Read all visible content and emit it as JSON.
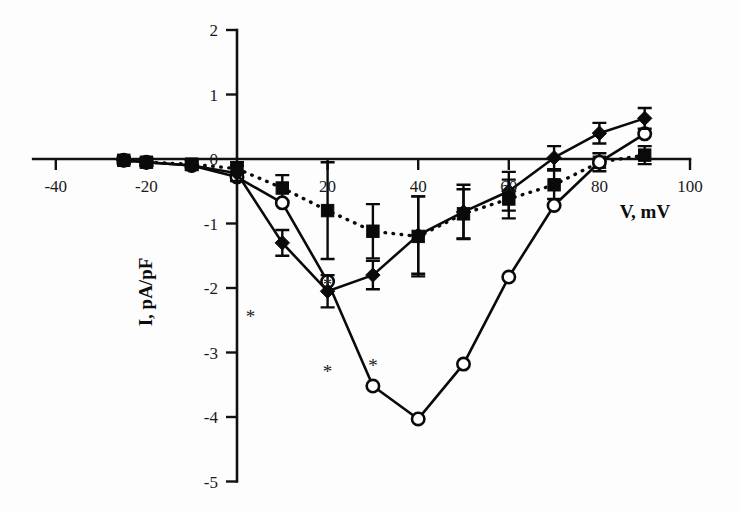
{
  "chart_data": {
    "type": "line",
    "title": "",
    "subtitle": "",
    "xlabel": "V, mV",
    "ylabel": "I, pA/pF",
    "xlim": [
      -45,
      100
    ],
    "ylim": [
      -5,
      2
    ],
    "grid": false,
    "legend_position": "none",
    "xticks": [
      -40,
      -20,
      0,
      20,
      40,
      60,
      80,
      100
    ],
    "xtick_labels": [
      "-40",
      "-20",
      "0",
      "20",
      "40",
      "60",
      "80",
      "100"
    ],
    "yticks": [
      2,
      1,
      0,
      -1,
      -2,
      -3,
      -4,
      -5
    ],
    "ytick_labels": [
      "2",
      "1",
      "0",
      "-1",
      "-2",
      "-3",
      "-4",
      "-5"
    ],
    "annotations": [
      {
        "text": "*",
        "x": 3,
        "y": -2.55
      },
      {
        "text": "*",
        "x": 20,
        "y": -2.05
      },
      {
        "text": "*",
        "x": 20,
        "y": -3.4
      },
      {
        "text": "*",
        "x": 30,
        "y": -3.3
      }
    ],
    "series": [
      {
        "name": "filled-diamond-solid",
        "marker": "filled-diamond",
        "line_style": "solid",
        "x": [
          -25,
          -20,
          -10,
          0,
          10,
          20,
          30,
          40,
          50,
          60,
          70,
          80,
          90
        ],
        "y": [
          -0.02,
          -0.05,
          -0.1,
          -0.22,
          -1.3,
          -2.05,
          -1.8,
          -1.18,
          -0.82,
          -0.5,
          0.02,
          0.4,
          0.63
        ],
        "yerr": [
          0.05,
          0.06,
          0.07,
          0.12,
          0.2,
          0.25,
          0.22,
          0.6,
          0.42,
          0.3,
          0.18,
          0.16,
          0.16
        ]
      },
      {
        "name": "open-circle-solid",
        "marker": "open-circle",
        "line_style": "solid",
        "x": [
          -25,
          -20,
          -10,
          0,
          10,
          20,
          30,
          40,
          50,
          60,
          70,
          80,
          90
        ],
        "y": [
          -0.02,
          -0.05,
          -0.1,
          -0.28,
          -0.68,
          -1.9,
          -3.52,
          -4.03,
          -3.18,
          -1.83,
          -0.72,
          -0.05,
          0.39
        ],
        "yerr": [
          0,
          0,
          0,
          0,
          0,
          0,
          0,
          0,
          0,
          0,
          0,
          0,
          0
        ]
      },
      {
        "name": "filled-square-dotted",
        "marker": "filled-square",
        "line_style": "dotted",
        "x": [
          -25,
          -20,
          -10,
          0,
          10,
          20,
          30,
          40,
          50,
          60,
          70,
          80,
          90
        ],
        "y": [
          -0.02,
          -0.05,
          -0.08,
          -0.15,
          -0.45,
          -0.8,
          -1.12,
          -1.2,
          -0.85,
          -0.62,
          -0.4,
          -0.05,
          0.06
        ],
        "yerr": [
          0.05,
          0.05,
          0.06,
          0.1,
          0.2,
          0.75,
          0.42,
          0.62,
          0.38,
          0.3,
          0.22,
          0.14,
          0.14
        ]
      }
    ]
  },
  "colors": {
    "ink": "#0a0a0a",
    "background": "#ffffff"
  }
}
